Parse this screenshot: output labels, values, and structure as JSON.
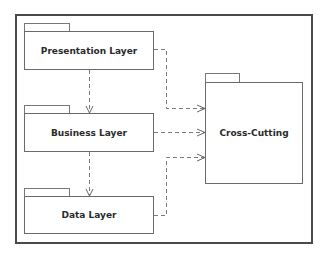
{
  "diagram": {
    "type": "UML package diagram",
    "packages": [
      {
        "id": "presentation",
        "label": "Presentation Layer"
      },
      {
        "id": "business",
        "label": "Business Layer"
      },
      {
        "id": "data",
        "label": "Data Layer"
      },
      {
        "id": "cross_cutting",
        "label": "Cross-Cutting"
      }
    ],
    "dependencies": [
      {
        "from": "Presentation Layer",
        "to": "Business Layer",
        "style": "dashed-open-arrow"
      },
      {
        "from": "Business Layer",
        "to": "Data Layer",
        "style": "dashed-open-arrow"
      },
      {
        "from": "Presentation Layer",
        "to": "Cross-Cutting",
        "style": "dashed-open-arrow"
      },
      {
        "from": "Business Layer",
        "to": "Cross-Cutting",
        "style": "dashed-open-arrow"
      },
      {
        "from": "Data Layer",
        "to": "Cross-Cutting",
        "style": "dashed-open-arrow"
      }
    ],
    "colors": {
      "frame": "#4a4a4a",
      "box": "#6a6a6a",
      "connector": "#7a7a7a",
      "text": "#2a2a2a"
    }
  }
}
